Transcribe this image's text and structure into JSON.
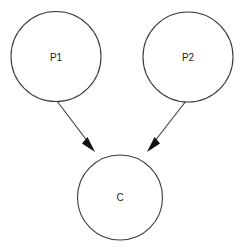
{
  "diagram": {
    "type": "directed-graph",
    "background_color": "#ffffff",
    "stroke_color": "#3b3b3b",
    "label_color": "#1a1a1a",
    "arrow_color": "#111111",
    "stroke_width": 1,
    "nodes": [
      {
        "id": "p1",
        "label": "P1",
        "cx": 56,
        "cy": 56.5,
        "r": 45,
        "label_x": 56,
        "label_y": 57
      },
      {
        "id": "p2",
        "label": "P2",
        "cx": 188,
        "cy": 57,
        "r": 45,
        "label_x": 188,
        "label_y": 57
      },
      {
        "id": "c",
        "label": "C",
        "cx": 120,
        "cy": 197.5,
        "r": 42.5,
        "label_x": 120,
        "label_y": 197
      }
    ],
    "edges": [
      {
        "id": "p1-to-c",
        "from": "p1",
        "to": "c",
        "label": "",
        "x1": 57,
        "y1": 101,
        "x2": 93,
        "y2": 149,
        "head_points": "93,150 83.5,142.5 86.5,139"
      },
      {
        "id": "p2-to-c",
        "from": "p2",
        "to": "c",
        "label": "",
        "x1": 186,
        "y1": 101,
        "x2": 149,
        "y2": 149,
        "head_points": "148,150 157.5,142.5 154.5,139"
      }
    ]
  }
}
